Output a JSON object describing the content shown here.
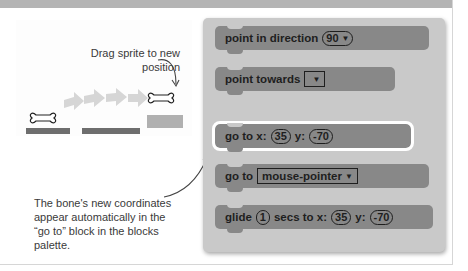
{
  "annotations": {
    "drag": "Drag sprite to new position",
    "coords": "The bone's new coordinates appear automatically in the “go to” block in the blocks palette."
  },
  "palette": {
    "blocks": [
      {
        "label": "point in direction",
        "input": "90",
        "input_type": "dropdown-pill"
      },
      {
        "label": "point towards",
        "input": "",
        "input_type": "dropdown-box"
      },
      {
        "label_a": "go to x:",
        "x": "35",
        "label_b": "y:",
        "y": "-70",
        "highlighted": true
      },
      {
        "label": "go to",
        "input": "mouse-pointer",
        "input_type": "dropdown-box"
      },
      {
        "label_a": "glide",
        "secs": "1",
        "label_b": "secs to x:",
        "x": "35",
        "label_c": "y:",
        "y": "-70"
      }
    ]
  },
  "icons": {
    "dropdown": "▼"
  },
  "colors": {
    "block": "#888888",
    "palette": "#c9c9c9",
    "top_bar": "#b4b4b4",
    "motion_arrows": "#d4d4d4"
  }
}
